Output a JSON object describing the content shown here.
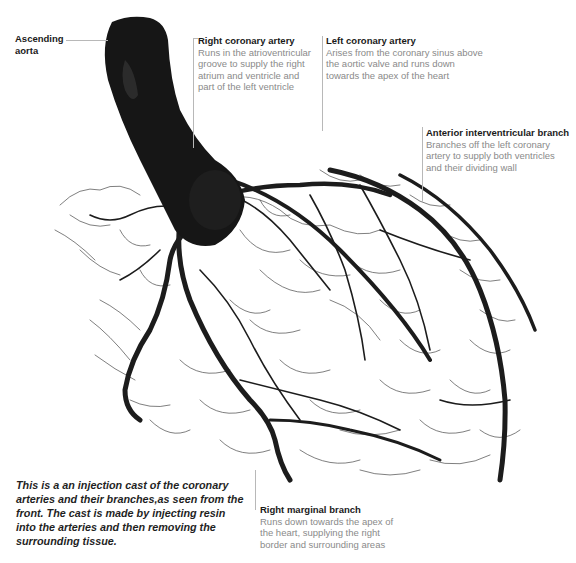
{
  "figure": {
    "colors": {
      "cast": "#1c1c1c",
      "leader_line": "#b8b8b8",
      "label_title": "#1a1a1a",
      "label_body": "#8a8a8a"
    }
  },
  "labels": {
    "ascending_aorta": {
      "title": "Ascending aorta",
      "title_line1": "Ascending",
      "title_line2": "aorta"
    },
    "right_coronary": {
      "title": "Right coronary artery",
      "body": "Runs in the atrioventricular groove to supply the right atrium and ventricle and part of the left ventricle"
    },
    "left_coronary": {
      "title": "Left coronary artery",
      "body": "Arises from the coronary sinus above the aortic valve and runs down towards the apex of the heart"
    },
    "anterior_interventricular": {
      "title": "Anterior interventricular branch",
      "body": "Branches off the left coronary artery to supply both ventricles and their dividing wall"
    },
    "right_marginal": {
      "title": "Right marginal branch",
      "body": "Runs down towards the apex of the heart, supplying the right border and surrounding areas"
    }
  },
  "caption": "This is a an injection cast of the coronary arteries and their branches,as seen from the front. The cast is made by injecting resin into the arteries and then removing the surrounding tissue."
}
